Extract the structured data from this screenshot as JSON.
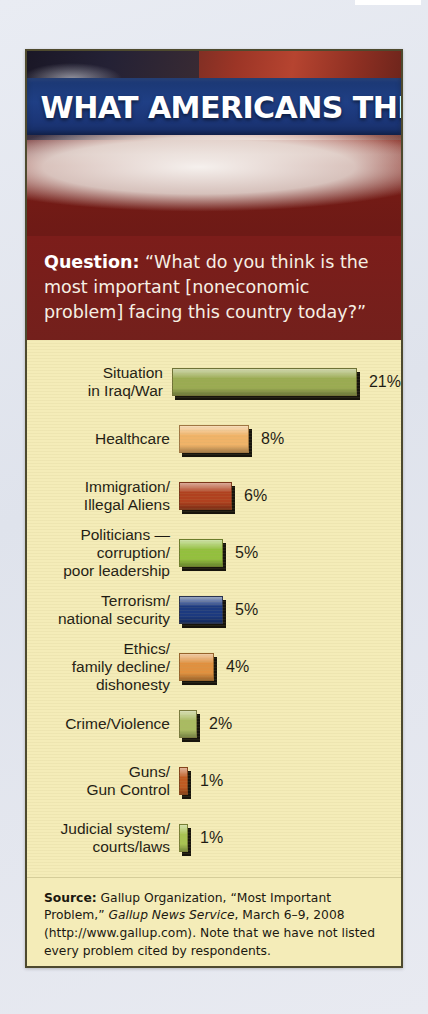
{
  "header": {
    "title": "WHAT AMERICANS THINK",
    "flag_image": "american-flag-photo"
  },
  "question": {
    "label": "Question:",
    "text": " “What do you think is the most important [noneconomic problem] facing this country today?”"
  },
  "chart_data": {
    "type": "bar",
    "title": "WHAT AMERICANS THINK",
    "xlabel": "",
    "ylabel": "",
    "orientation": "horizontal",
    "unit": "%",
    "xlim": [
      0,
      21
    ],
    "grid": false,
    "legend": false,
    "categories": [
      "Situation\nin Iraq/War",
      "Healthcare",
      "Immigration/\nIllegal Aliens",
      "Politicians —\ncorruption/\npoor leadership",
      "Terrorism/\nnational security",
      "Ethics/\nfamily decline/\ndishonesty",
      "Crime/Violence",
      "Guns/\nGun Control",
      "Judicial system/\ncourts/laws"
    ],
    "values": [
      21,
      8,
      6,
      5,
      5,
      4,
      2,
      1,
      1
    ],
    "value_labels": [
      "21%",
      "8%",
      "6%",
      "5%",
      "5%",
      "4%",
      "2%",
      "1%",
      "1%"
    ],
    "colors": [
      "#9aab52",
      "#f0b368",
      "#b0411f",
      "#93c03e",
      "#1c3a80",
      "#e0903f",
      "#a9bb62",
      "#c05a22",
      "#a8c352"
    ]
  },
  "source": {
    "label": "Source:",
    "text_1": " Gallup Organization, “Most Important Problem,” ",
    "italic": "Gallup News Service",
    "text_2": ", March 6–9, 2008 (http://www.gallup.com). Note that we have not listed every problem cited by respondents."
  },
  "colors": {
    "page_background": "#e6e9f0",
    "panel_background": "#f4ecb8",
    "question_background": "#7c1d1a",
    "title_band": "#1f3f85",
    "border": "#4e4a2e",
    "text": "#1d1a12"
  }
}
